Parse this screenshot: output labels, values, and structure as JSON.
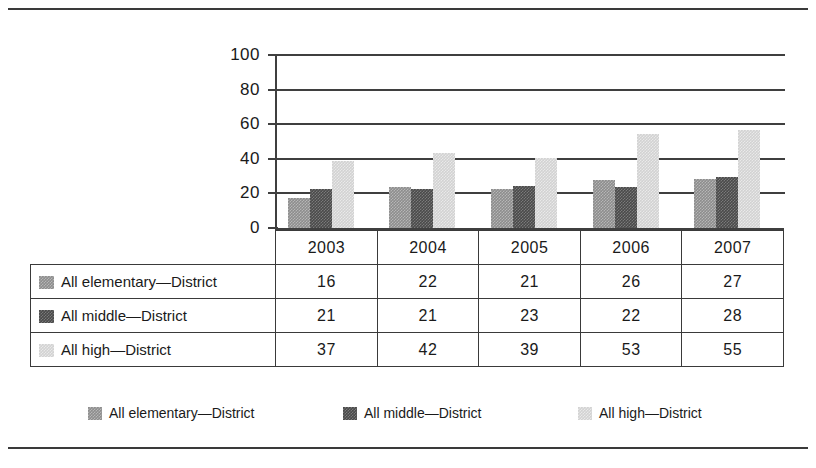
{
  "chart_data": {
    "type": "bar",
    "title": "",
    "xlabel": "",
    "ylabel": "",
    "ylim": [
      0,
      100
    ],
    "yticks": [
      0,
      20,
      40,
      60,
      80,
      100
    ],
    "grid": true,
    "legend_position": "bottom",
    "categories": [
      "2003",
      "2004",
      "2005",
      "2006",
      "2007"
    ],
    "series": [
      {
        "name": "All elementary—District",
        "color": "#8d8d8d",
        "values": [
          16,
          22,
          21,
          26,
          27
        ]
      },
      {
        "name": "All middle—District",
        "color": "#4a4a4a",
        "values": [
          21,
          21,
          23,
          22,
          28
        ]
      },
      {
        "name": "All high—District",
        "color": "#d2d2d2",
        "values": [
          37,
          42,
          39,
          53,
          55
        ]
      }
    ]
  },
  "axis": {
    "ytick_labels": [
      "100",
      "80",
      "60",
      "40",
      "20",
      "0"
    ]
  },
  "table": {
    "year_headers": [
      "2003",
      "2004",
      "2005",
      "2006",
      "2007"
    ],
    "rows": [
      {
        "label": "All elementary—District",
        "swatch": "elem",
        "values": [
          "16",
          "22",
          "21",
          "26",
          "27"
        ]
      },
      {
        "label": "All middle—District",
        "swatch": "mid",
        "values": [
          "21",
          "21",
          "23",
          "22",
          "28"
        ]
      },
      {
        "label": "All high—District",
        "swatch": "high",
        "values": [
          "37",
          "42",
          "39",
          "53",
          "55"
        ]
      }
    ]
  },
  "legend": {
    "items": [
      {
        "label": "All elementary—District",
        "swatch": "elem"
      },
      {
        "label": "All middle—District",
        "swatch": "mid"
      },
      {
        "label": "All high—District",
        "swatch": "high"
      }
    ]
  }
}
